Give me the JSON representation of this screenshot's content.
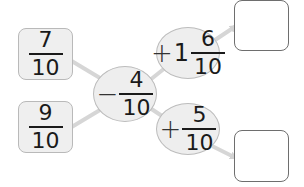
{
  "diagram": {
    "inputs": [
      {
        "numerator": "7",
        "denominator": "10"
      },
      {
        "numerator": "9",
        "denominator": "10"
      }
    ],
    "center_operation": {
      "operator": "−",
      "numerator": "4",
      "denominator": "10"
    },
    "branch_operations": [
      {
        "operator": "+",
        "whole": "1",
        "numerator": "6",
        "denominator": "10"
      },
      {
        "operator": "+",
        "numerator": "5",
        "denominator": "10"
      }
    ],
    "answer_boxes": [
      {
        "value": ""
      },
      {
        "value": ""
      }
    ],
    "colors": {
      "box_fill": "#efefef",
      "box_border": "#b9b9b9",
      "connector": "#d6d6d6",
      "answer_border": "#6e6e6e",
      "text": "#1a1a1a"
    }
  }
}
